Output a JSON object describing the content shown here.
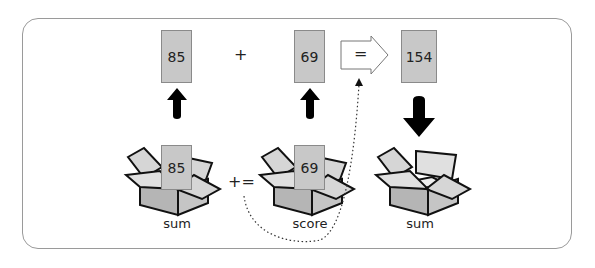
{
  "diagram": {
    "top_row": {
      "left_value": "85",
      "plus": "+",
      "right_value": "69",
      "equals": "=",
      "result_value": "154"
    },
    "boxes": [
      {
        "name": "sum",
        "content": "85",
        "label": "sum"
      },
      {
        "name": "score",
        "content": "69",
        "label": "score"
      },
      {
        "name": "sum-result",
        "content": "",
        "label": "sum"
      }
    ],
    "operator": "+=",
    "colors": {
      "card": "#c8c8c8",
      "box_front": "#b5b5b5",
      "box_flap": "#d6d6d6",
      "stroke": "#111111",
      "frame": "#9a9a9a"
    }
  }
}
